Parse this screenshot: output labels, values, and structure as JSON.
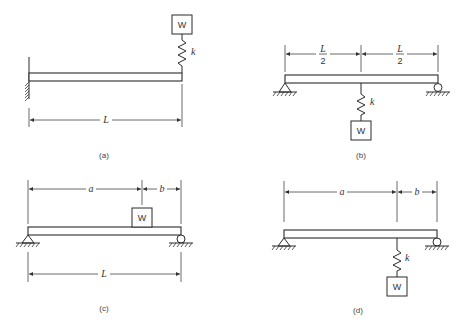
{
  "figure": {
    "panels": [
      {
        "id": "a",
        "caption": "(a)",
        "description": "Cantilever beam with weight on spring at free end",
        "weight_label": "W",
        "spring_label": "k",
        "dimension_label": "L"
      },
      {
        "id": "b",
        "caption": "(b)",
        "description": "Simply supported beam with weight hanging from spring at midspan",
        "weight_label": "W",
        "spring_label": "k",
        "dim_left": {
          "num": "L",
          "den": "2"
        },
        "dim_right": {
          "num": "L",
          "den": "2"
        }
      },
      {
        "id": "c",
        "caption": "(c)",
        "description": "Simply supported beam with weight resting on beam at distance a from left support",
        "weight_label": "W",
        "dim_a": "a",
        "dim_b": "b",
        "dimension_label": "L"
      },
      {
        "id": "d",
        "caption": "(d)",
        "description": "Simply supported beam with weight hanging from spring at distance a from left support",
        "weight_label": "W",
        "spring_label": "k",
        "dim_a": "a",
        "dim_b": "b"
      }
    ]
  }
}
